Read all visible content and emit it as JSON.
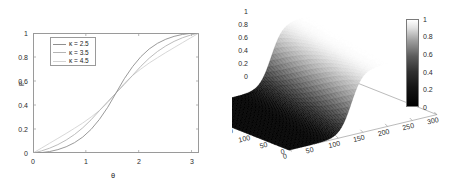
{
  "figure": {
    "background": "#ffffff",
    "panels": [
      "left-2d-line-plot",
      "right-3d-surface-plot"
    ]
  },
  "chart_data": [
    {
      "id": "left-2d",
      "type": "line",
      "title": "",
      "xlabel": "θ",
      "ylabel": "P",
      "xlim": [
        0,
        3.14159
      ],
      "ylim": [
        0,
        1
      ],
      "grid": false,
      "legend_position": "upper-left",
      "xticks": [
        "0",
        "1",
        "2",
        "3"
      ],
      "xtick_values": [
        0,
        1,
        2,
        3
      ],
      "yticks": [
        "0",
        "0.2",
        "0.4",
        "0.6",
        "0.8",
        "1"
      ],
      "ytick_values": [
        0,
        0.2,
        0.4,
        0.6,
        0.8,
        1
      ],
      "series": [
        {
          "name": "κ = 2.5",
          "kappa": 2.5,
          "color": "#8f8f8f",
          "x": [
            0,
            0.157,
            0.314,
            0.471,
            0.628,
            0.785,
            0.942,
            1.1,
            1.257,
            1.414,
            1.571,
            1.728,
            1.885,
            2.042,
            2.199,
            2.356,
            2.513,
            2.67,
            2.827,
            2.985,
            3.142
          ],
          "values": [
            0.0,
            0.003,
            0.012,
            0.028,
            0.052,
            0.086,
            0.133,
            0.197,
            0.28,
            0.381,
            0.5,
            0.619,
            0.72,
            0.803,
            0.867,
            0.914,
            0.948,
            0.972,
            0.988,
            0.997,
            1.0
          ]
        },
        {
          "name": "κ = 3.5",
          "kappa": 3.5,
          "color": "#b4b4b4",
          "x": [
            0,
            0.157,
            0.314,
            0.471,
            0.628,
            0.785,
            0.942,
            1.1,
            1.257,
            1.414,
            1.571,
            1.728,
            1.885,
            2.042,
            2.199,
            2.356,
            2.513,
            2.67,
            2.827,
            2.985,
            3.142
          ],
          "values": [
            0.0,
            0.017,
            0.04,
            0.07,
            0.108,
            0.154,
            0.21,
            0.277,
            0.353,
            0.428,
            0.5,
            0.572,
            0.647,
            0.723,
            0.79,
            0.846,
            0.892,
            0.93,
            0.96,
            0.983,
            1.0
          ]
        },
        {
          "name": "κ = 4.5",
          "kappa": 4.5,
          "color": "#d2d2d2",
          "x": [
            0,
            0.157,
            0.314,
            0.471,
            0.628,
            0.785,
            0.942,
            1.1,
            1.257,
            1.414,
            1.571,
            1.728,
            1.885,
            2.042,
            2.199,
            2.356,
            2.513,
            2.67,
            2.827,
            2.985,
            3.142
          ],
          "values": [
            0.0,
            0.04,
            0.081,
            0.122,
            0.163,
            0.206,
            0.25,
            0.3,
            0.354,
            0.42,
            0.5,
            0.58,
            0.646,
            0.7,
            0.75,
            0.794,
            0.837,
            0.878,
            0.919,
            0.96,
            1.0
          ]
        }
      ]
    },
    {
      "id": "right-3d",
      "type": "heatmap",
      "render": "3d-surface",
      "title": "",
      "xlabel": "",
      "ylabel": "",
      "zlabel": "",
      "xlim": [
        0,
        300
      ],
      "ylim": [
        0,
        300
      ],
      "zlim": [
        0,
        1
      ],
      "colormap": "gray",
      "colorbar": {
        "min": 0,
        "max": 1,
        "ticks": [
          "0",
          "0.2",
          "0.4",
          "0.6",
          "0.8",
          "1"
        ],
        "tick_values": [
          0,
          0.2,
          0.4,
          0.6,
          0.8,
          1
        ],
        "low_color": "#000000",
        "high_color": "#ffffff"
      },
      "xticks": [
        "0",
        "50",
        "100",
        "150",
        "200",
        "250",
        "300"
      ],
      "xtick_values": [
        0,
        50,
        100,
        150,
        200,
        250,
        300
      ],
      "yticks": [
        "0",
        "50",
        "100",
        "150",
        "200",
        "250",
        "300"
      ],
      "ytick_values": [
        0,
        50,
        100,
        150,
        200,
        250,
        300
      ],
      "zticks": [
        "0",
        "0.2",
        "0.4",
        "0.6",
        "0.8",
        "1"
      ],
      "ztick_values": [
        0,
        0.2,
        0.4,
        0.6,
        0.8,
        1
      ],
      "description": "Sigmoidal step surface: low plateau near 0 over small x, sharp rise to high plateau near 1 at large x"
    }
  ],
  "left_plot": {
    "ylabel": "P",
    "xlabel": "θ",
    "yticks": [
      "1",
      "0.8",
      "0.6",
      "0.4",
      "0.2",
      "0"
    ],
    "xticks": [
      "0",
      "1",
      "2",
      "3"
    ],
    "legend": {
      "items": [
        {
          "label": "κ = 2.5"
        },
        {
          "label": "κ = 3.5"
        },
        {
          "label": "κ = 4.5"
        }
      ]
    }
  },
  "right_plot": {
    "zticks": [
      "1",
      "0.8",
      "0.6",
      "0.4",
      "0.2",
      "0"
    ],
    "yticks": [
      "300",
      "250",
      "200",
      "150",
      "100",
      "50",
      "0"
    ],
    "xticks": [
      "0",
      "50",
      "100",
      "150",
      "200",
      "250",
      "300"
    ],
    "colorbar_ticks": [
      "1",
      "0.8",
      "0.6",
      "0.4",
      "0.2",
      "0"
    ]
  }
}
